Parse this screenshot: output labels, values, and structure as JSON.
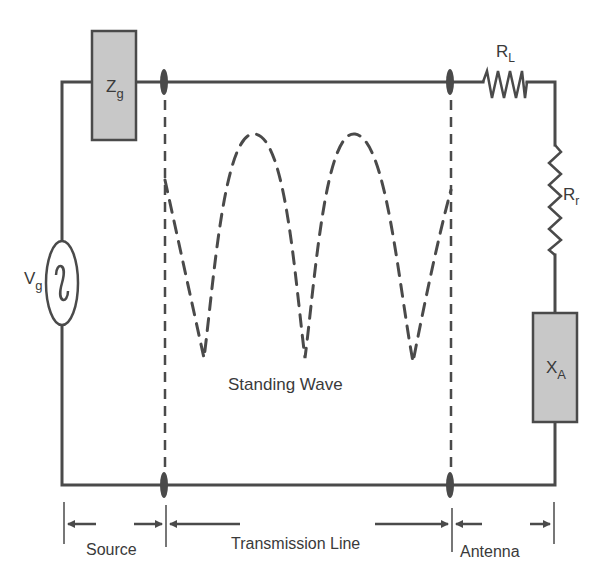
{
  "diagram": {
    "type": "circuit",
    "components": {
      "source_impedance": {
        "symbol": "Z",
        "subscript": "g"
      },
      "source_voltage": {
        "symbol": "V",
        "subscript": "g",
        "glyph": "~"
      },
      "loss_resistance": {
        "symbol": "R",
        "subscript": "L"
      },
      "radiation_resistance": {
        "symbol": "R",
        "subscript": "r"
      },
      "antenna_reactance": {
        "symbol": "X",
        "subscript": "A"
      }
    },
    "wave_label": "Standing Wave",
    "sections": {
      "source": "Source",
      "transmission_line": "Transmission Line",
      "antenna": "Antenna"
    },
    "colors": {
      "wire": "#4a4a4a",
      "box_fill": "#c8c8c8",
      "box_stroke": "#4a4a4a",
      "text": "#3a3a3a",
      "background": "#ffffff"
    }
  }
}
